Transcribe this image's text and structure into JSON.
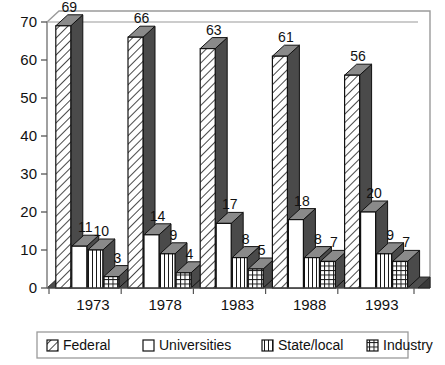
{
  "chart_data": {
    "type": "bar",
    "title": "",
    "subtitle": "",
    "xlabel": "",
    "ylabel": "",
    "categories": [
      "1973",
      "1978",
      "1983",
      "1988",
      "1993"
    ],
    "series": [
      {
        "name": "Federal",
        "pattern": "diagonal-hatch",
        "values": [
          69,
          66,
          63,
          61,
          56
        ]
      },
      {
        "name": "Universities",
        "pattern": "solid-white",
        "values": [
          11,
          14,
          17,
          18,
          20
        ]
      },
      {
        "name": "State/local",
        "pattern": "vertical-lines",
        "values": [
          10,
          9,
          8,
          8,
          9
        ]
      },
      {
        "name": "Industry",
        "pattern": "grid-crosshatch",
        "values": [
          3,
          4,
          5,
          7,
          7
        ]
      }
    ],
    "ylim": [
      0,
      70
    ],
    "yticks": [
      0,
      10,
      20,
      30,
      40,
      50,
      60,
      70
    ],
    "ytick_labels": [
      "0",
      "10",
      "20",
      "30",
      "40",
      "50",
      "60",
      "70"
    ],
    "grid": false,
    "data_labels": true,
    "legend_position": "bottom",
    "style": "3d-bars",
    "colors": {
      "bar_face": "#ffffff",
      "bar_side": "#4a4a4a",
      "bar_top": "#8a8a8a",
      "floor": "#4e4e4e",
      "outline": "#111111",
      "frame": "#9a9a9a",
      "text": "#111111",
      "background": "#ffffff"
    }
  },
  "legend": {
    "items": [
      {
        "label": "Federal",
        "swatch": "diagonal-hatch-swatch"
      },
      {
        "label": "Universities",
        "swatch": "solid-white-swatch"
      },
      {
        "label": "State/local",
        "swatch": "vertical-lines-swatch"
      },
      {
        "label": "Industry",
        "swatch": "grid-crosshatch-swatch"
      }
    ]
  }
}
